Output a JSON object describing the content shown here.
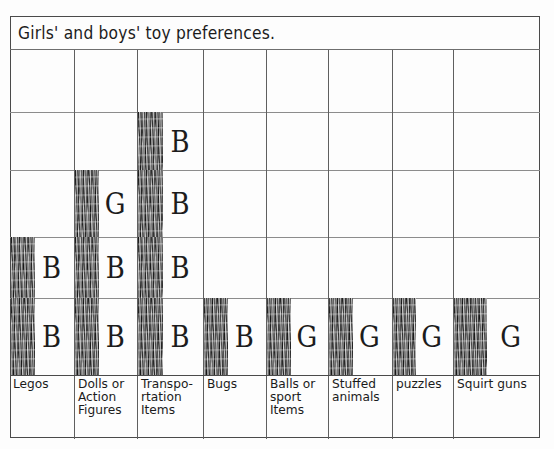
{
  "title": "Girls' and boys' toy preferences.",
  "chart_data": {
    "type": "bar",
    "title": "Girls' and boys' toy preferences.",
    "xlabel": "",
    "ylabel": "",
    "ylim": [
      0,
      5
    ],
    "grid": true,
    "legend": "none",
    "note": "Hand-drawn pictograph-style bar chart on grid paper. Each filled cell of a bar is annotated with a letter indicating which group chose it: B = boys, G = girls.",
    "categories": [
      "Legos",
      "Dolls or Action Figures",
      "Transpo-rtation Items",
      "Bugs",
      "Balls or sport Items",
      "Stuffed animals",
      "puzzles",
      "Squirt guns"
    ],
    "values": [
      2,
      3,
      4,
      1,
      1,
      1,
      1,
      1
    ],
    "cell_letters": [
      [
        "B",
        "B"
      ],
      [
        "B",
        "B",
        "G"
      ],
      [
        "B",
        "B",
        "B",
        "B"
      ],
      [
        "B"
      ],
      [
        "G"
      ],
      [
        "G"
      ],
      [
        "G"
      ],
      [
        "G"
      ]
    ],
    "letter_key": {
      "B": "boys",
      "G": "girls"
    }
  },
  "bars": [
    {
      "label": "Legos",
      "count": 2,
      "letters": [
        "B",
        "B"
      ]
    },
    {
      "label": "Dolls or Action Figures",
      "count": 3,
      "letters": [
        "B",
        "B",
        "G"
      ]
    },
    {
      "label": "Transpo-rtation Items",
      "count": 4,
      "letters": [
        "B",
        "B",
        "B",
        "B"
      ]
    },
    {
      "label": "Bugs",
      "count": 1,
      "letters": [
        "B"
      ]
    },
    {
      "label": "Balls or sport Items",
      "count": 1,
      "letters": [
        "G"
      ]
    },
    {
      "label": "Stuffed animals",
      "count": 1,
      "letters": [
        "G"
      ]
    },
    {
      "label": "puzzles",
      "count": 1,
      "letters": [
        "G"
      ]
    },
    {
      "label": "Squirt guns",
      "count": 1,
      "letters": [
        "G"
      ]
    }
  ],
  "colors": {
    "paper": "#fdfdfd",
    "ink": "#1b1b1b",
    "grid_line": "#8c8c8c",
    "frame_line": "#4a4a4a",
    "bar_fill": "#151515"
  }
}
